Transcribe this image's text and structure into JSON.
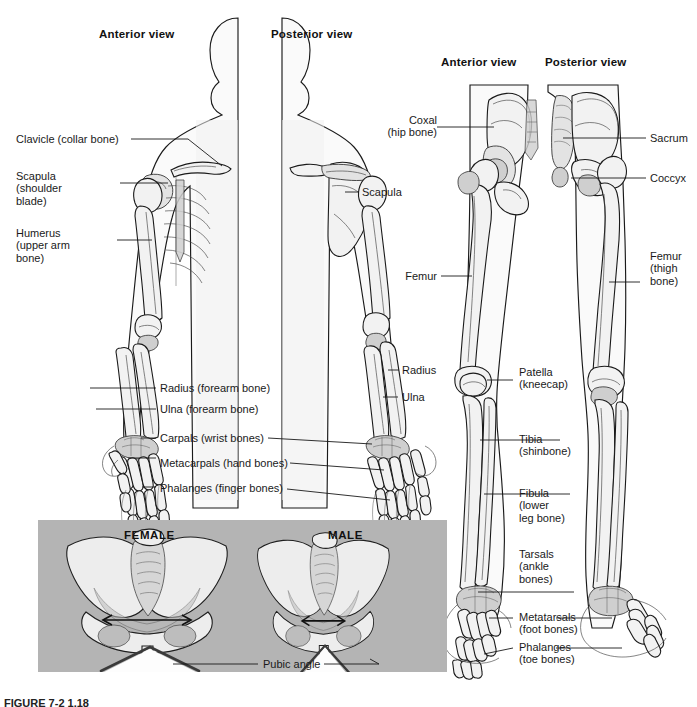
{
  "figure": {
    "caption": "FIGURE 7-2  1.18"
  },
  "upper_body_panel": {
    "view_labels": [
      {
        "text": "Anterior view"
      },
      {
        "text": "Posterior view"
      }
    ],
    "labels_left": [
      {
        "text": "Clavicle (collar bone)"
      },
      {
        "text": "Scapula\n(shoulder\nblade)"
      },
      {
        "text": "Humerus\n(upper arm\nbone)"
      },
      {
        "text": "Radius (forearm bone)"
      },
      {
        "text": "Ulna (forearm bone)"
      },
      {
        "text": "Carpals (wrist bones)"
      },
      {
        "text": "Metacarpals (hand bones)"
      },
      {
        "text": "Phalanges (finger bones)"
      }
    ],
    "labels_right": [
      {
        "text": "Scapula"
      },
      {
        "text": "Radius"
      },
      {
        "text": "Ulna"
      }
    ]
  },
  "lower_body_panel": {
    "view_labels": [
      {
        "text": "Anterior view"
      },
      {
        "text": "Posterior view"
      }
    ],
    "labels_left": [
      {
        "text": "Coxal\n(hip bone)"
      },
      {
        "text": "Femur"
      },
      {
        "text": "Patella\n(kneecap)"
      },
      {
        "text": "Tibia\n(shinbone)"
      },
      {
        "text": "Fibula\n(lower\nleg bone)"
      },
      {
        "text": "Tarsals\n(ankle\nbones)"
      },
      {
        "text": "Metatarsals\n(foot bones)"
      },
      {
        "text": "Phalanges\n(toe bones)"
      }
    ],
    "labels_right": [
      {
        "text": "Sacrum"
      },
      {
        "text": "Coccyx"
      },
      {
        "text": "Femur\n(thigh\nbone)"
      }
    ]
  },
  "pelvis_panel": {
    "background_color": "#b4b4b4",
    "female_label": "FEMALE",
    "male_label": "MALE",
    "pubic_angle_label": "Pubic angle"
  }
}
